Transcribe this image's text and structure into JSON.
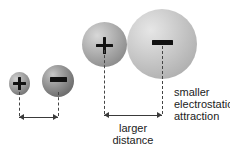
{
  "diagram": {
    "background_color": "#ffffff",
    "ink_color": "#1b1b1b"
  },
  "pairs": [
    {
      "id": "close-pair",
      "positive": {
        "charge_symbol": "+",
        "size_label": "small"
      },
      "negative": {
        "charge_symbol": "–",
        "size_label": "medium"
      },
      "distance_label": ""
    },
    {
      "id": "far-pair",
      "positive": {
        "charge_symbol": "+",
        "size_label": "large"
      },
      "negative": {
        "charge_symbol": "–",
        "size_label": "largest"
      },
      "distance_label": "larger\ndistance"
    }
  ],
  "labels": {
    "larger_distance": "larger\ndistance",
    "smaller_attraction": "smaller\nelectrostatic\nattraction"
  },
  "charges": {
    "plus": "+",
    "minus": "–"
  }
}
